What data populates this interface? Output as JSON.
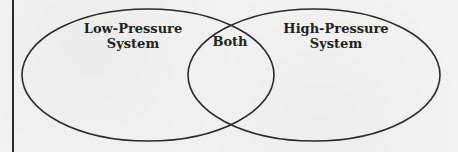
{
  "diagram": {
    "type": "venn",
    "sets": [
      {
        "id": "left",
        "label_line1": "Low-Pressure",
        "label_line2": "System"
      },
      {
        "id": "right",
        "label_line1": "High-Pressure",
        "label_line2": "System"
      }
    ],
    "intersection_label": "Both"
  },
  "colors": {
    "stroke": "#2a2a2a",
    "text": "#222222",
    "background": "#f2f2f0"
  }
}
